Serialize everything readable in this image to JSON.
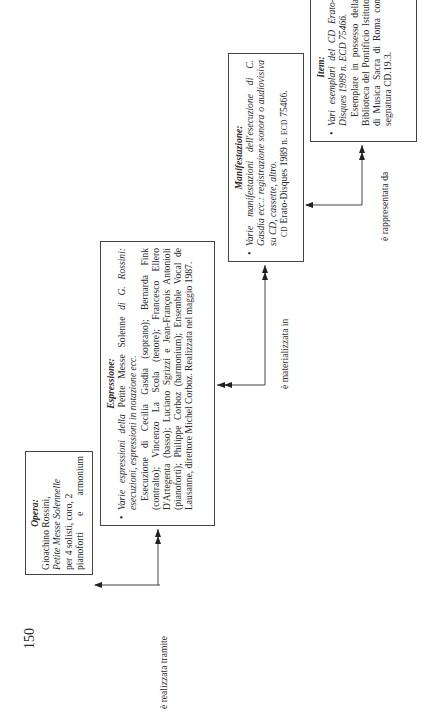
{
  "page_number": "150",
  "opera": {
    "title": "Opera",
    "author": "Gioachino Rossini,",
    "work": "Petite Messe Solennelle",
    "detail1": "per 4 solisti, coro, 2",
    "detail2": "pianoforti e armonium"
  },
  "espressione": {
    "title": "Espressione",
    "bullet_lead": "Varie espressioni della",
    "bullet_work": "Petite Messe Solenne",
    "bullet_rest": "di G. Rossini: esecuzioni, espressioni in notazione ecc.",
    "body": "Esecuzione di Cecilia Gasdia (soprano); Bernarda Fink (contralto); Vincenzo La Scola (tenore); Francesco Ellero D'Artegenta (basso); Luciano Sgrizzi e Jean-François Antonioli (pianoforti); Philippe Corboz (harmonium); Ensemble Vocal de Lausanne, direttore Michel Corboz. Realizzata nel maggio 1987."
  },
  "manifestazione": {
    "title": "Manifestazione",
    "bullet": "Varie manifestazioni dell'esecuzione di C. Gasdia ecc.: registrazione sonora o audiovisiva su CD, cassette, altro.",
    "body_cd": "CD",
    "body_rest": "Erato-Disques 1989 n.",
    "body_ecd": "ECD",
    "body_num": "75466."
  },
  "item": {
    "title": "Item",
    "bullet": "Vari esemplari del CD Erato-Disques 1989 n. ECD 75466.",
    "body": "Esemplare in possesso della Biblioteca del Pontificio Istituto di Musica Sacra di Roma con segnatura CD.19.3."
  },
  "relations": {
    "opera_espressione": "è realizzata tramite",
    "espressione_manifestazione": "è materializzata in",
    "manifestazione_item": "è rappresentata da"
  }
}
